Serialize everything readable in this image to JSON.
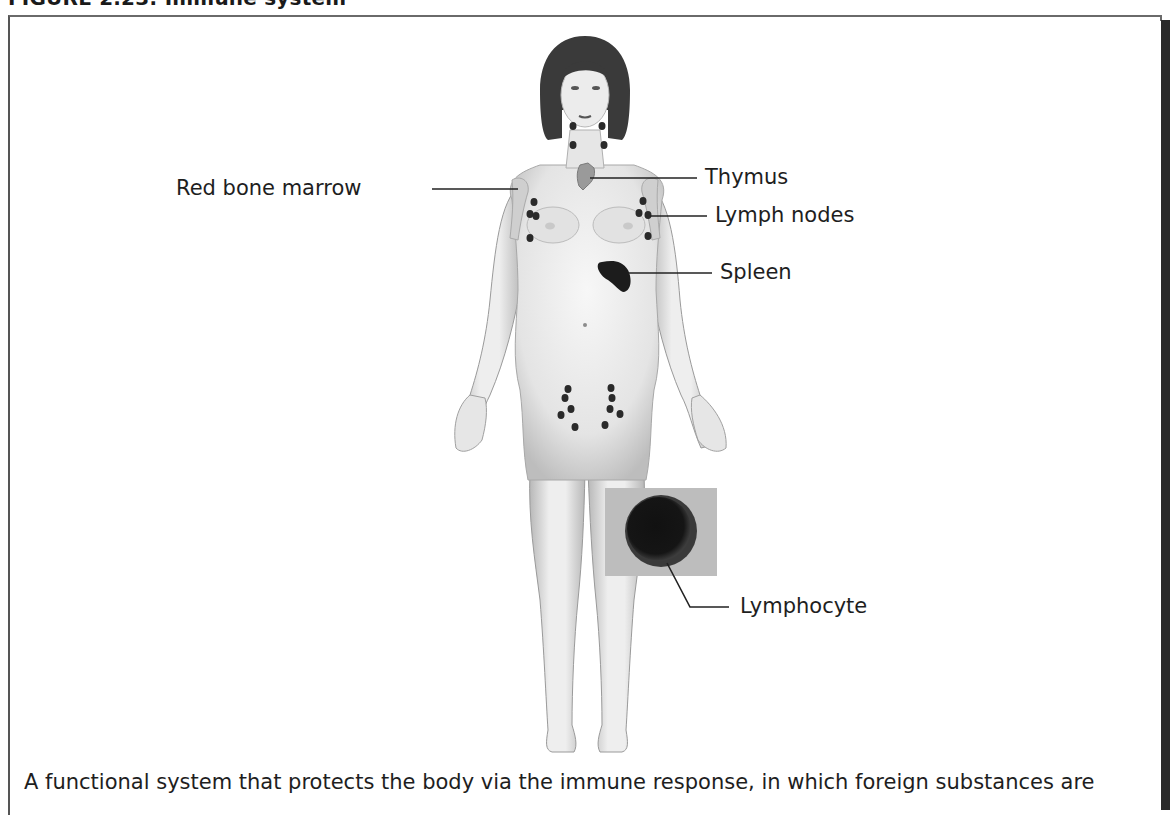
{
  "figure": {
    "title": "FIGURE 2.23: Immune system",
    "caption": "A functional system that protects the body via the immune response, in which foreign substances are"
  },
  "labels": {
    "red_bone_marrow": "Red bone marrow",
    "thymus": "Thymus",
    "lymph_nodes": "Lymph nodes",
    "spleen": "Spleen",
    "lymphocyte": "Lymphocyte"
  },
  "colors": {
    "skin": "#ececec",
    "skin_shade": "#c4c4c4",
    "hair": "#3a3a3a",
    "organ_dark": "#1c1c1c",
    "thymus": "#9a9a9a",
    "lymphocyte_bg": "#bdbdbd",
    "frame_shadow": "#2a2a2a"
  }
}
